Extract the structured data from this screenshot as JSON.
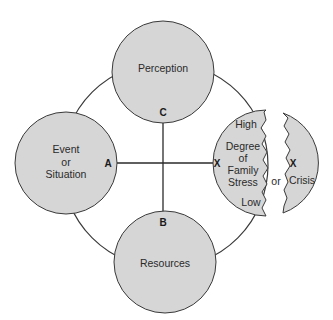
{
  "diagram": {
    "nodes": {
      "perception": {
        "label": "Perception",
        "letter": "C"
      },
      "event": {
        "lines": [
          "Event",
          "or",
          "Situation"
        ],
        "letter": "A"
      },
      "resources": {
        "label": "Resources",
        "letter": "B"
      },
      "stress": {
        "high": "High",
        "lines": [
          "Degree",
          "of",
          "Family",
          "Stress"
        ],
        "low": "Low",
        "letter": "X"
      },
      "crisis": {
        "label": "Crisis",
        "letter": "X"
      }
    },
    "connector": "or",
    "colors": {
      "fill": "#d6d6d6",
      "stroke": "#3a3a3a",
      "background": "#ffffff"
    }
  }
}
